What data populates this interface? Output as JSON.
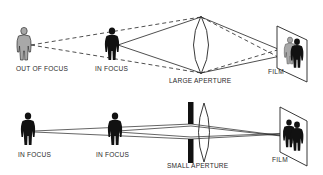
{
  "top_panel": {
    "figure_left_label": "OUT OF FOCUS",
    "figure_mid_label": "IN FOCUS",
    "lens_label": "LARGE APERTURE",
    "film_label": "FILM"
  },
  "bottom_panel": {
    "figure_left_label": "IN FOCUS",
    "figure_mid_label": "IN FOCUS",
    "lens_label": "SMALL APERTURE",
    "film_label": "FILM"
  },
  "colors": {
    "ink": "#111111",
    "out_of_focus_fill": "#a8a8a8",
    "background": "#ffffff"
  }
}
